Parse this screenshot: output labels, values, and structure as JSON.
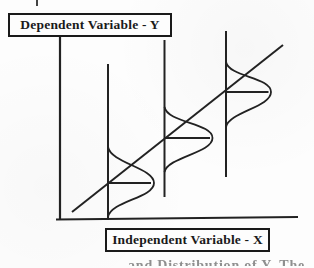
{
  "figure": {
    "y_axis_label": "Dependent Variable - Y",
    "x_axis_label": "Independent Variable - X",
    "normal_curve_count": 3,
    "caption_fragment": "and Distribution of Y.   The"
  },
  "colors": {
    "ink": "#222222",
    "paper": "#fdfdfd",
    "caption_ink": "#8f8f8f"
  }
}
